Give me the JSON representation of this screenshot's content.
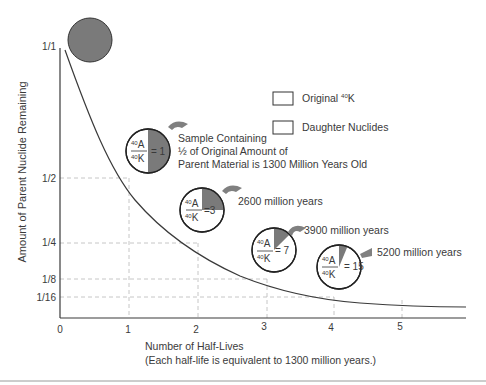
{
  "diagram": {
    "y_axis": {
      "label": "Amount of Parent Nuclide Remaining",
      "ticks": [
        "1/1",
        "1/2",
        "1/4",
        "1/8",
        "1/16"
      ]
    },
    "x_axis": {
      "label_line1": "Number of Half-Lives",
      "label_line2": "(Each half-life is equivalent to 1300 million years.)",
      "ticks": [
        "0",
        "1",
        "2",
        "3",
        "4",
        "5"
      ]
    },
    "legend": {
      "items": [
        {
          "label": "Original ",
          "sup": "40",
          "label_suffix": "K"
        },
        {
          "label": "Daughter Nuclides"
        }
      ]
    },
    "samples": [
      {
        "ratio_num": "40",
        "ratio_num_el": "A",
        "ratio_den": "40",
        "ratio_den_el": "K",
        "ratio_value": "= 1",
        "daughter_fraction": 0.5,
        "annotation_line1": "Sample Containing",
        "annotation_line2": "½ of Original Amount of",
        "annotation_line3": "Parent Material is 1300 Million Years Old"
      },
      {
        "ratio_num": "40",
        "ratio_num_el": "A",
        "ratio_den": "40",
        "ratio_den_el": "K",
        "ratio_value": "=3",
        "daughter_fraction": 0.25,
        "annotation_line1": "2600 million years"
      },
      {
        "ratio_num": "40",
        "ratio_num_el": "A",
        "ratio_den": "40",
        "ratio_den_el": "K",
        "ratio_value": "= 7",
        "daughter_fraction": 0.125,
        "annotation_line1": "3900 million years"
      },
      {
        "ratio_num": "40",
        "ratio_num_el": "A",
        "ratio_den": "40",
        "ratio_den_el": "K",
        "ratio_value": "= 15",
        "daughter_fraction": 0.0625,
        "annotation_line1": "5200 million years"
      }
    ],
    "colors": {
      "parent_fill": "#7a7a7a",
      "daughter_fill": "#ffffff",
      "line": "#3a3a3a",
      "grid": "#b8b8b8",
      "arrow": "#808080"
    }
  }
}
